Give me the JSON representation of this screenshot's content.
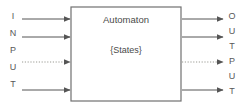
{
  "diagram": {
    "colors": {
      "stroke": "#555555",
      "box_border": "#707070",
      "text": "#4a4a4a",
      "label_text": "#585858",
      "dotted": "#9a9a93",
      "background": "#ffffff"
    },
    "box": {
      "label_primary": "Automaton",
      "label_secondary": "{States}",
      "x": 71,
      "y": 7,
      "width": 110,
      "height": 94
    },
    "input": {
      "label": "INPUT",
      "letters": [
        "I",
        "N",
        "P",
        "U",
        "T"
      ],
      "arrow_count": 4,
      "arrows": [
        {
          "index": 1,
          "y": 19,
          "style": "solid"
        },
        {
          "index": 2,
          "y": 37,
          "style": "solid"
        },
        {
          "index": 3,
          "y": 62,
          "style": "dotted"
        },
        {
          "index": 4,
          "y": 90,
          "style": "solid"
        }
      ]
    },
    "output": {
      "label": "OUTPUT",
      "letters": [
        "O",
        "U",
        "T",
        "P",
        "U",
        "T"
      ],
      "arrow_count": 4,
      "arrows": [
        {
          "index": 1,
          "y": 19,
          "style": "solid"
        },
        {
          "index": 2,
          "y": 37,
          "style": "solid"
        },
        {
          "index": 3,
          "y": 62,
          "style": "dotted"
        },
        {
          "index": 4,
          "y": 90,
          "style": "solid"
        }
      ]
    }
  }
}
